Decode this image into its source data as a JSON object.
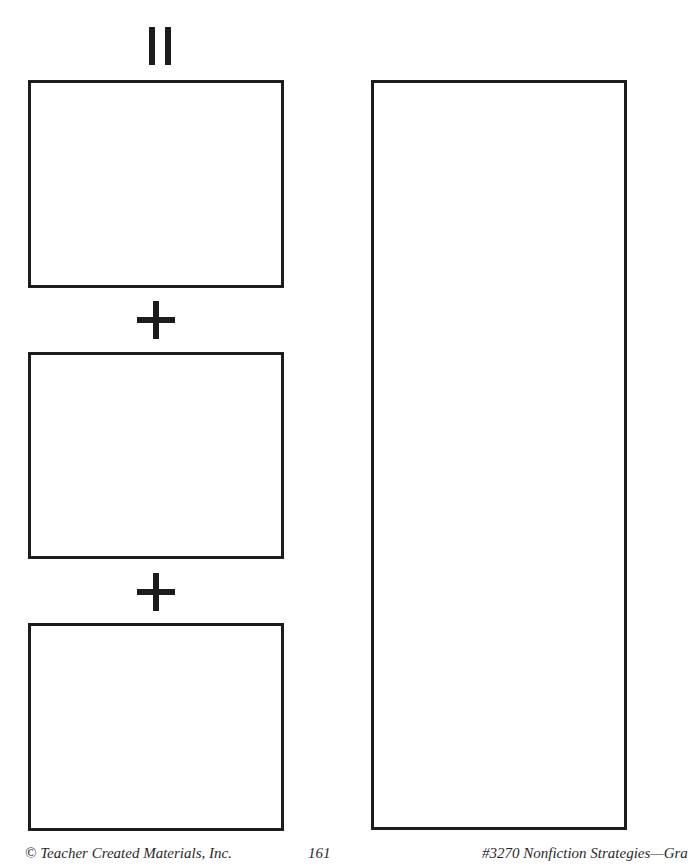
{
  "worksheet": {
    "symbols": {
      "equals": "equals-sign",
      "plus_1": "plus-sign",
      "plus_2": "plus-sign"
    },
    "boxes": [
      {
        "id": "answer-box-top",
        "content": ""
      },
      {
        "id": "answer-box-middle",
        "content": ""
      },
      {
        "id": "answer-box-bottom",
        "content": ""
      },
      {
        "id": "answer-box-tall-right",
        "content": ""
      }
    ]
  },
  "footer": {
    "copyright": "© Teacher Created Materials, Inc.",
    "page_number": "161",
    "book_title": "#3270 Nonfiction Strategies—Gra"
  }
}
